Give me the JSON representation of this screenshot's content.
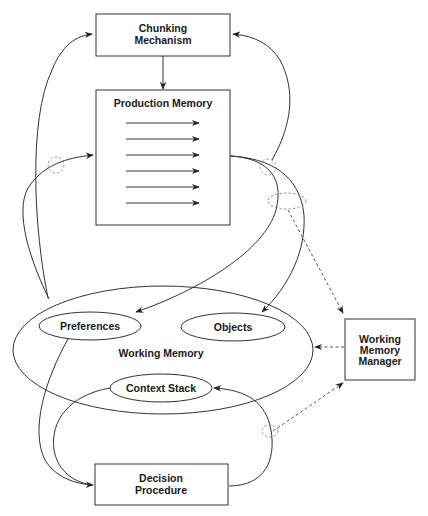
{
  "diagram": {
    "nodes": {
      "chunking": {
        "line1": "Chunking",
        "line2": "Mechanism"
      },
      "production": {
        "title": "Production Memory",
        "rule_arrows": 6
      },
      "working_memory": {
        "title": "Working Memory"
      },
      "preferences": {
        "label": "Preferences"
      },
      "objects": {
        "label": "Objects"
      },
      "context_stack": {
        "label": "Context Stack"
      },
      "wmm": {
        "line1": "Working",
        "line2": "Memory",
        "line3": "Manager"
      },
      "decision": {
        "line1": "Decision",
        "line2": "Procedure"
      }
    },
    "edges": [
      {
        "from": "Chunking Mechanism",
        "to": "Production Memory",
        "style": "solid"
      },
      {
        "from": "Working Memory",
        "to": "Chunking Mechanism",
        "style": "solid"
      },
      {
        "from": "Working Memory",
        "to": "Production Memory",
        "style": "solid"
      },
      {
        "from": "Production Memory",
        "to": "Chunking Mechanism",
        "style": "solid"
      },
      {
        "from": "Production Memory",
        "to": "Preferences",
        "style": "solid"
      },
      {
        "from": "Production Memory",
        "to": "Objects",
        "style": "solid"
      },
      {
        "from": "Production Memory",
        "to": "Working Memory Manager",
        "style": "dashed"
      },
      {
        "from": "Working Memory Manager",
        "to": "Working Memory",
        "style": "dashed"
      },
      {
        "from": "Decision Procedure",
        "to": "Working Memory Manager",
        "style": "dashed"
      },
      {
        "from": "Preferences",
        "to": "Decision Procedure",
        "style": "solid"
      },
      {
        "from": "Context Stack",
        "to": "Decision Procedure",
        "style": "solid"
      },
      {
        "from": "Decision Procedure",
        "to": "Context Stack",
        "style": "solid"
      }
    ],
    "colors": {
      "stroke": "#333333",
      "text": "#1a1a1a",
      "background": "#ffffff"
    }
  }
}
